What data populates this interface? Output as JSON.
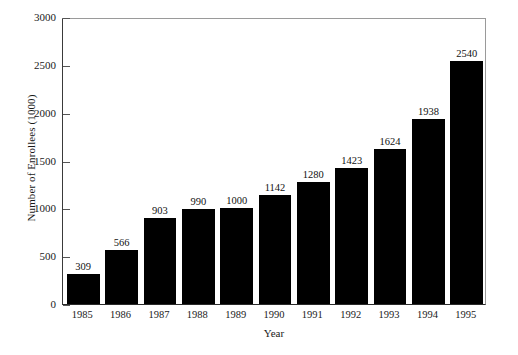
{
  "chart_data": {
    "type": "bar",
    "title": "",
    "xlabel": "Year",
    "ylabel": "Number of Enrollees (1000)",
    "categories": [
      "1985",
      "1986",
      "1987",
      "1988",
      "1989",
      "1990",
      "1991",
      "1992",
      "1993",
      "1994",
      "1995"
    ],
    "values": [
      309,
      566,
      903,
      990,
      1000,
      1142,
      1280,
      1423,
      1624,
      1938,
      2540
    ],
    "data_labels": [
      "309",
      "566",
      "903",
      "990",
      "1000",
      "1142",
      "1280",
      "1423",
      "1624",
      "1938",
      "2540"
    ],
    "ylim": [
      0,
      3000
    ],
    "ytick_values": [
      0,
      500,
      1000,
      1500,
      2000,
      2500,
      3000
    ],
    "ytick_labels": [
      "0",
      "500",
      "1000",
      "1500",
      "2000",
      "2500",
      "3000"
    ],
    "grid": false,
    "legend": null,
    "series": [
      {
        "name": "Number of Enrollees (1000)",
        "values": [
          309,
          566,
          903,
          990,
          1000,
          1142,
          1280,
          1423,
          1624,
          1938,
          2540
        ]
      }
    ],
    "colors": {
      "bar": "#000000",
      "axis": "#2a2a2a",
      "frame": "#9a9a9a",
      "text": "#1a1a1a",
      "background": "#ffffff"
    }
  }
}
